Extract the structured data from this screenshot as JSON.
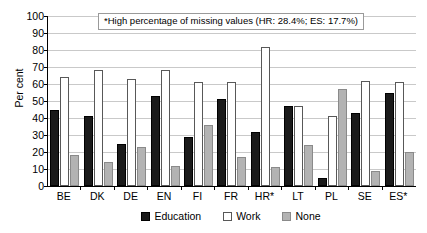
{
  "chart_data": {
    "type": "bar",
    "title": "",
    "subtitle": "",
    "xlabel": "",
    "ylabel": "Per cent",
    "ylim": [
      0,
      100
    ],
    "ytick_step": 10,
    "yticks": [
      0,
      10,
      20,
      30,
      40,
      50,
      60,
      70,
      80,
      90,
      100
    ],
    "grid": true,
    "legend_position": "bottom",
    "categories": [
      "BE",
      "DK",
      "DE",
      "EN",
      "FI",
      "FR",
      "HR*",
      "LT",
      "PL",
      "SE",
      "ES*"
    ],
    "series": [
      {
        "name": "Education",
        "color": "#1a1a1a",
        "values": [
          45,
          41,
          25,
          53,
          29,
          51,
          32,
          47,
          5,
          43,
          55
        ]
      },
      {
        "name": "Work",
        "color": "#ffffff",
        "values": [
          64,
          68,
          63,
          68,
          61,
          61,
          82,
          47,
          41,
          62,
          61
        ]
      },
      {
        "name": "None",
        "color": "#b3b3b3",
        "values": [
          18,
          14,
          23,
          12,
          36,
          17,
          11,
          24,
          57,
          9,
          20
        ]
      }
    ],
    "annotations": [
      {
        "text": "*High percentage of missing values (HR: 28.4%; ES: 17.7%)",
        "boxed": true
      }
    ]
  },
  "legend": {
    "items": [
      {
        "label": "Education",
        "swatch": "education"
      },
      {
        "label": "Work",
        "swatch": "work"
      },
      {
        "label": "None",
        "swatch": "none"
      }
    ]
  }
}
